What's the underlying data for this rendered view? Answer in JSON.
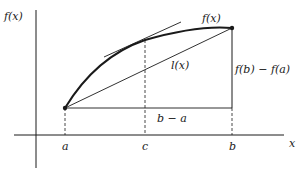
{
  "figure": {
    "type": "mean-value-theorem",
    "labels": {
      "y_axis": "f(x)",
      "x_axis": "x",
      "curve": "f(x)",
      "secant": "l(x)",
      "rise": "f(b) − f(a)",
      "run": "b − a",
      "a": "a",
      "c": "c",
      "b": "b"
    },
    "colors": {
      "ink": "#1a1a1a",
      "background": "#ffffff"
    }
  }
}
